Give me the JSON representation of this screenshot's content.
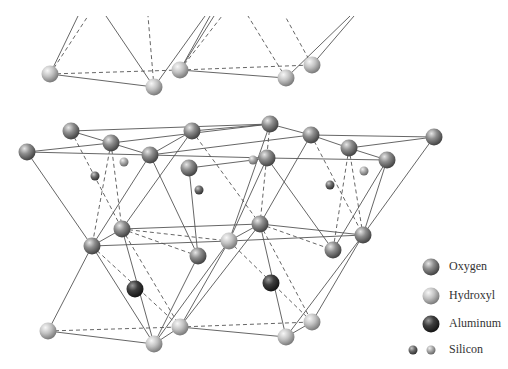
{
  "colors": {
    "background": "#ffffff",
    "bond": "#555555",
    "oxygen": "#8a8a8a",
    "hydroxyl": "#c4c4c4",
    "aluminum": "#3c3c3c",
    "silicon_dark": "#6e6e6e",
    "silicon_light": "#b0b0b0"
  },
  "legend": {
    "items": [
      {
        "label": "Oxygen",
        "type": "oxygen"
      },
      {
        "label": "Hydroxyl",
        "type": "hydroxyl"
      },
      {
        "label": "Aluminum",
        "type": "aluminum"
      },
      {
        "label": "Silicon",
        "type": "silicon"
      }
    ]
  },
  "atoms": [
    {
      "type": "hydroxyl",
      "x": 50,
      "y": 74
    },
    {
      "type": "hydroxyl",
      "x": 154,
      "y": 87
    },
    {
      "type": "hydroxyl",
      "x": 180,
      "y": 70
    },
    {
      "type": "hydroxyl",
      "x": 286,
      "y": 78
    },
    {
      "type": "hydroxyl",
      "x": 312,
      "y": 65
    },
    {
      "type": "oxygen",
      "x": 71,
      "y": 131
    },
    {
      "type": "oxygen",
      "x": 111,
      "y": 143
    },
    {
      "type": "oxygen",
      "x": 150,
      "y": 155
    },
    {
      "type": "oxygen",
      "x": 192,
      "y": 131
    },
    {
      "type": "oxygen",
      "x": 270,
      "y": 124
    },
    {
      "type": "oxygen",
      "x": 311,
      "y": 135
    },
    {
      "type": "oxygen",
      "x": 349,
      "y": 148
    },
    {
      "type": "oxygen",
      "x": 27,
      "y": 152
    },
    {
      "type": "oxygen",
      "x": 189,
      "y": 168
    },
    {
      "type": "oxygen",
      "x": 267,
      "y": 158
    },
    {
      "type": "oxygen",
      "x": 387,
      "y": 160
    },
    {
      "type": "oxygen",
      "x": 434,
      "y": 137
    },
    {
      "type": "silicon_dark",
      "x": 95,
      "y": 176
    },
    {
      "type": "silicon_light",
      "x": 124,
      "y": 162
    },
    {
      "type": "silicon_dark",
      "x": 199,
      "y": 190
    },
    {
      "type": "silicon_light",
      "x": 253,
      "y": 160
    },
    {
      "type": "silicon_dark",
      "x": 330,
      "y": 185
    },
    {
      "type": "silicon_light",
      "x": 364,
      "y": 171
    },
    {
      "type": "oxygen",
      "x": 122,
      "y": 229
    },
    {
      "type": "oxygen",
      "x": 92,
      "y": 246
    },
    {
      "type": "oxygen",
      "x": 198,
      "y": 256
    },
    {
      "type": "hydroxyl",
      "x": 229,
      "y": 241
    },
    {
      "type": "oxygen",
      "x": 260,
      "y": 224
    },
    {
      "type": "oxygen",
      "x": 333,
      "y": 250
    },
    {
      "type": "oxygen",
      "x": 363,
      "y": 235
    },
    {
      "type": "aluminum",
      "x": 135,
      "y": 289
    },
    {
      "type": "aluminum",
      "x": 271,
      "y": 283
    },
    {
      "type": "hydroxyl",
      "x": 48,
      "y": 331
    },
    {
      "type": "hydroxyl",
      "x": 154,
      "y": 344
    },
    {
      "type": "hydroxyl",
      "x": 180,
      "y": 327
    },
    {
      "type": "hydroxyl",
      "x": 286,
      "y": 337
    },
    {
      "type": "hydroxyl",
      "x": 312,
      "y": 322
    }
  ],
  "bonds_solid": [
    [
      50,
      74,
      78,
      16
    ],
    [
      154,
      87,
      106,
      16
    ],
    [
      154,
      87,
      205,
      16
    ],
    [
      180,
      70,
      210,
      16
    ],
    [
      180,
      70,
      214,
      16
    ],
    [
      286,
      78,
      350,
      16
    ],
    [
      312,
      65,
      354,
      16
    ],
    [
      50,
      74,
      154,
      87
    ],
    [
      180,
      70,
      286,
      78
    ],
    [
      71,
      131,
      270,
      124
    ],
    [
      71,
      131,
      111,
      143
    ],
    [
      111,
      143,
      27,
      152
    ],
    [
      27,
      152,
      150,
      155
    ],
    [
      111,
      143,
      150,
      155
    ],
    [
      111,
      143,
      270,
      124
    ],
    [
      150,
      155,
      192,
      131
    ],
    [
      192,
      131,
      270,
      124
    ],
    [
      270,
      124,
      311,
      135
    ],
    [
      311,
      135,
      434,
      137
    ],
    [
      311,
      135,
      349,
      148
    ],
    [
      349,
      148,
      434,
      137
    ],
    [
      349,
      148,
      387,
      160
    ],
    [
      189,
      168,
      253,
      160
    ],
    [
      253,
      160,
      267,
      158
    ],
    [
      267,
      158,
      387,
      160
    ],
    [
      150,
      155,
      267,
      158
    ],
    [
      311,
      135,
      150,
      155
    ],
    [
      27,
      152,
      92,
      246
    ],
    [
      150,
      155,
      92,
      246
    ],
    [
      150,
      155,
      198,
      256
    ],
    [
      189,
      168,
      198,
      256
    ],
    [
      192,
      131,
      122,
      229
    ],
    [
      270,
      124,
      229,
      241
    ],
    [
      267,
      158,
      229,
      241
    ],
    [
      267,
      158,
      333,
      250
    ],
    [
      311,
      135,
      260,
      224
    ],
    [
      387,
      160,
      363,
      235
    ],
    [
      434,
      137,
      363,
      235
    ],
    [
      387,
      160,
      333,
      250
    ],
    [
      122,
      229,
      92,
      246
    ],
    [
      92,
      246,
      229,
      241
    ],
    [
      122,
      229,
      260,
      224
    ],
    [
      229,
      241,
      363,
      235
    ],
    [
      260,
      224,
      363,
      235
    ],
    [
      229,
      241,
      260,
      224
    ],
    [
      92,
      246,
      48,
      331
    ],
    [
      92,
      246,
      154,
      344
    ],
    [
      122,
      229,
      154,
      344
    ],
    [
      229,
      241,
      154,
      344
    ],
    [
      229,
      241,
      180,
      327
    ],
    [
      260,
      224,
      180,
      327
    ],
    [
      198,
      256,
      154,
      344
    ],
    [
      260,
      224,
      286,
      337
    ],
    [
      363,
      235,
      312,
      322
    ],
    [
      363,
      235,
      286,
      337
    ],
    [
      48,
      331,
      154,
      344
    ],
    [
      154,
      344,
      180,
      327
    ],
    [
      180,
      327,
      286,
      337
    ],
    [
      286,
      337,
      312,
      322
    ]
  ],
  "bonds_dashed": [
    [
      50,
      74,
      88,
      16
    ],
    [
      154,
      87,
      148,
      16
    ],
    [
      180,
      70,
      222,
      16
    ],
    [
      286,
      78,
      248,
      16
    ],
    [
      312,
      65,
      285,
      16
    ],
    [
      50,
      74,
      180,
      70
    ],
    [
      180,
      70,
      312,
      65
    ],
    [
      71,
      131,
      122,
      229
    ],
    [
      111,
      143,
      92,
      246
    ],
    [
      111,
      143,
      122,
      229
    ],
    [
      192,
      131,
      260,
      224
    ],
    [
      270,
      124,
      260,
      224
    ],
    [
      311,
      135,
      363,
      235
    ],
    [
      349,
      148,
      333,
      250
    ],
    [
      349,
      148,
      363,
      235
    ],
    [
      122,
      229,
      229,
      241
    ],
    [
      260,
      224,
      333,
      250
    ],
    [
      92,
      246,
      180,
      327
    ],
    [
      122,
      229,
      198,
      256
    ],
    [
      122,
      229,
      180,
      327
    ],
    [
      229,
      241,
      312,
      322
    ],
    [
      260,
      224,
      312,
      322
    ],
    [
      48,
      331,
      180,
      327
    ],
    [
      180,
      327,
      312,
      322
    ]
  ]
}
